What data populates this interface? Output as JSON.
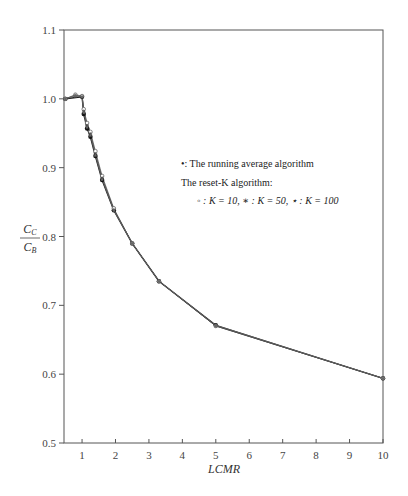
{
  "chart_data": {
    "type": "line",
    "title": "",
    "xlabel": "LCMR",
    "ylabel": {
      "numerator": "C_C",
      "denominator": "C_B",
      "num_main": "C",
      "num_sub": "C",
      "den_main": "C",
      "den_sub": "B"
    },
    "xlim": [
      0.46,
      10
    ],
    "ylim": [
      0.5,
      1.1
    ],
    "xticks": [
      1,
      2,
      3,
      4,
      5,
      6,
      7,
      8,
      9,
      10
    ],
    "yticks": [
      0.5,
      0.6,
      0.7,
      0.8,
      0.9,
      1.0,
      1.1
    ],
    "ytick_labels": [
      "0.5",
      "0.6",
      "0.7",
      "0.8",
      "0.9",
      "1.0",
      "1.1"
    ],
    "grid": false,
    "legend_position": "center-right",
    "legend": {
      "line1": "•: The running average algorithm",
      "line2": "The reset-K algorithm:",
      "line3": "◦ : K = 10, ∗ : K = 50, ⋆ : K = 100"
    },
    "series": [
      {
        "name": "The running average algorithm",
        "marker": "filled-circle",
        "x": [
          0.5,
          1.0,
          1.05,
          1.15,
          1.25,
          1.4,
          1.6,
          1.95,
          2.5,
          3.3,
          5.0,
          10.0
        ],
        "y": [
          1.0,
          1.003,
          0.978,
          0.957,
          0.945,
          0.917,
          0.882,
          0.838,
          0.79,
          0.735,
          0.671,
          0.594
        ]
      },
      {
        "name": "Reset-K, K = 10",
        "marker": "open-circle",
        "x": [
          0.5,
          0.8,
          1.0,
          1.05,
          1.15,
          1.25,
          1.4,
          1.6,
          1.95,
          2.5,
          3.3,
          5.0,
          10.0
        ],
        "y": [
          1.0,
          1.006,
          1.004,
          0.985,
          0.965,
          0.952,
          0.924,
          0.888,
          0.841,
          0.79,
          0.735,
          0.67,
          0.594
        ]
      },
      {
        "name": "Reset-K, K = 50",
        "marker": "asterisk",
        "x": [
          0.5,
          0.8,
          1.0,
          1.05,
          1.15,
          1.25,
          1.4,
          1.6,
          1.95,
          2.5,
          3.3,
          5.0,
          10.0
        ],
        "y": [
          1.0,
          1.005,
          1.003,
          0.982,
          0.961,
          0.949,
          0.92,
          0.885,
          0.839,
          0.79,
          0.735,
          0.67,
          0.594
        ]
      },
      {
        "name": "Reset-K, K = 100",
        "marker": "star",
        "x": [
          0.5,
          0.8,
          1.0,
          1.05,
          1.15,
          1.25,
          1.4,
          1.6,
          1.95,
          2.5,
          3.3,
          5.0,
          10.0
        ],
        "y": [
          1.0,
          1.004,
          1.003,
          0.98,
          0.959,
          0.947,
          0.918,
          0.883,
          0.838,
          0.79,
          0.735,
          0.671,
          0.594
        ]
      }
    ]
  }
}
